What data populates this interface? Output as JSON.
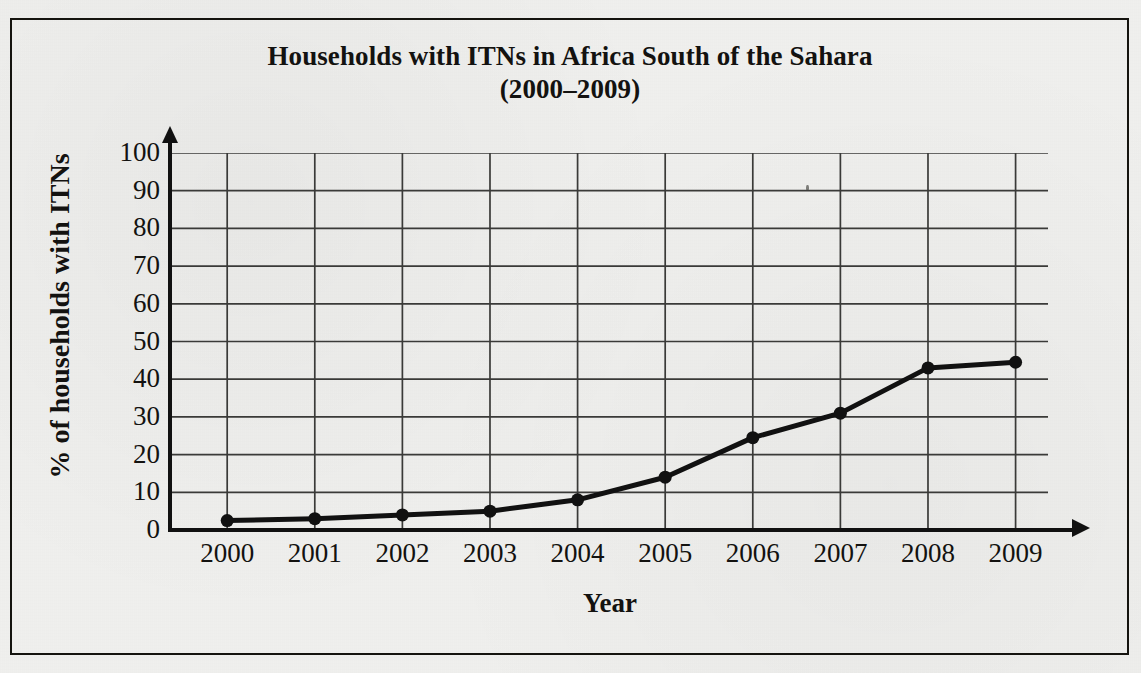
{
  "figure": {
    "title_line1": "Households with ITNs in Africa South of the Sahara",
    "title_line2": "(2000–2009)",
    "border_color": "#15140f",
    "background_color": "#f1f1ef"
  },
  "chart_data": {
    "type": "line",
    "title": "Households with ITNs in Africa South of the Sahara (2000–2009)",
    "xlabel": "Year",
    "ylabel": "% of households with ITNs",
    "categories": [
      "2000",
      "2001",
      "2002",
      "2003",
      "2004",
      "2005",
      "2006",
      "2007",
      "2008",
      "2009"
    ],
    "values": [
      2.5,
      3,
      4,
      5,
      8,
      14,
      24.5,
      31,
      43,
      44.5
    ],
    "series": [
      {
        "name": "% of households with ITNs",
        "values": [
          2.5,
          3,
          4,
          5,
          8,
          14,
          24.5,
          31,
          43,
          44.5
        ]
      }
    ],
    "ylim": [
      0,
      100
    ],
    "ytick_values": [
      0,
      10,
      20,
      30,
      40,
      50,
      60,
      70,
      80,
      90,
      100
    ],
    "ytick_labels": [
      "0",
      "10",
      "20",
      "30",
      "40",
      "50",
      "60",
      "70",
      "80",
      "90",
      "100"
    ],
    "xtick_labels": [
      "2000",
      "2001",
      "2002",
      "2003",
      "2004",
      "2005",
      "2006",
      "2007",
      "2008",
      "2009"
    ],
    "grid": true,
    "legend": false,
    "line_color": "#111111",
    "marker": "circle",
    "marker_color": "#111111"
  }
}
